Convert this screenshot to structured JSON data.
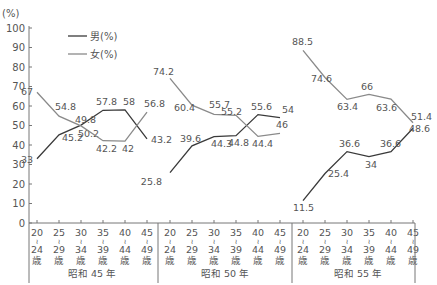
{
  "chart_data": {
    "type": "line",
    "title": "",
    "ylabel": "(%)",
    "xlabel": "",
    "ylim": [
      0,
      100
    ],
    "yticks": [
      0,
      10,
      20,
      30,
      40,
      50,
      60,
      70,
      80,
      90,
      100
    ],
    "grid": false,
    "legend": {
      "position": "top-left",
      "entries": [
        {
          "label": "男(%)",
          "color": "#3a3a3a"
        },
        {
          "label": "女(%)",
          "color": "#8a8a8a"
        }
      ]
    },
    "age_categories": [
      {
        "from": "20",
        "sep": "～",
        "to": "24",
        "unit": "歳"
      },
      {
        "from": "25",
        "sep": "～",
        "to": "29",
        "unit": "歳"
      },
      {
        "from": "30",
        "sep": "～",
        "to": "34",
        "unit": "歳"
      },
      {
        "from": "35",
        "sep": "～",
        "to": "39",
        "unit": "歳"
      },
      {
        "from": "40",
        "sep": "～",
        "to": "44",
        "unit": "歳"
      },
      {
        "from": "45",
        "sep": "～",
        "to": "49",
        "unit": "歳"
      }
    ],
    "groups": [
      {
        "label": "昭和 45 年",
        "series": [
          {
            "name": "男(%)",
            "values": [
              33,
              45.2,
              50.2,
              57.8,
              58,
              43.2
            ]
          },
          {
            "name": "女(%)",
            "values": [
              67,
              54.8,
              49.8,
              42.2,
              42,
              56.8
            ]
          }
        ]
      },
      {
        "label": "昭和 50 年",
        "series": [
          {
            "name": "男(%)",
            "values": [
              25.8,
              39.6,
              44.3,
              44.8,
              55.6,
              54
            ]
          },
          {
            "name": "女(%)",
            "values": [
              74.2,
              60.4,
              55.7,
              55.2,
              44.4,
              46
            ]
          }
        ]
      },
      {
        "label": "昭和 55 年",
        "series": [
          {
            "name": "男(%)",
            "values": [
              11.5,
              25.4,
              36.6,
              34,
              36.6,
              48.6
            ]
          },
          {
            "name": "女(%)",
            "values": [
              88.5,
              74.6,
              63.4,
              66,
              63.6,
              51.4
            ]
          }
        ]
      }
    ]
  }
}
